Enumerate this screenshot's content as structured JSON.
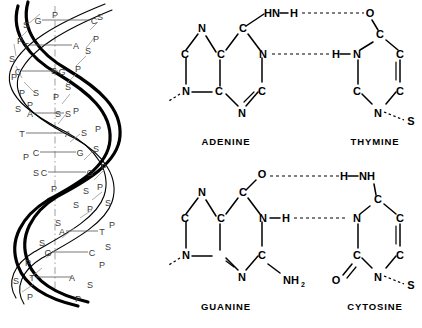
{
  "figure": {
    "panels": [
      "dna-helix",
      "adenine-thymine-pair",
      "guanine-cytosine-pair"
    ]
  },
  "helix": {
    "name": "DNA double helix",
    "backbone_units": {
      "sugar": "S",
      "phosphate": "P"
    },
    "axis_label": "",
    "rungs": [
      {
        "left": "G",
        "right": "C"
      },
      {
        "left": "T",
        "right": "A"
      },
      {
        "left": "C",
        "right": "G"
      },
      {
        "left": "A",
        "right": "S"
      },
      {
        "left": "T",
        "right": "A"
      },
      {
        "left": "C",
        "right": "G"
      },
      {
        "left": "C",
        "right": "G"
      },
      {
        "left": "A",
        "right": "T"
      },
      {
        "left": "G",
        "right": "C"
      },
      {
        "left": "T",
        "right": "A"
      }
    ],
    "backbone_sequence_left": [
      "S",
      "P",
      "S",
      "P",
      "S",
      "P",
      "S",
      "P",
      "S",
      "P",
      "S",
      "P"
    ],
    "backbone_sequence_right": [
      "P",
      "S",
      "P",
      "S",
      "P",
      "S",
      "P",
      "S",
      "P",
      "S",
      "P",
      "S"
    ]
  },
  "pair_at": {
    "name": "adenine-thymine base pair",
    "left_base": {
      "label": "ADENINE",
      "code": "A"
    },
    "right_base": {
      "label": "THYMINE",
      "code": "T"
    },
    "hydrogen_bond_count": 2,
    "hydrogen_bonds": [
      {
        "donor": "HN-H",
        "acceptor": "O"
      },
      {
        "donor": "H",
        "acceptor": "N"
      }
    ],
    "adenine_atoms": [
      "N",
      "C",
      "C",
      "C",
      "N",
      "N",
      "C",
      "C",
      "N"
    ],
    "adenine_amino": "HN",
    "adenine_amino_h": "H",
    "thymine_atoms": [
      "O",
      "C",
      "C",
      "N",
      "H",
      "C",
      "C",
      "N"
    ],
    "sugar_left": "S",
    "sugar_right": "S"
  },
  "pair_gc": {
    "name": "guanine-cytosine base pair",
    "left_base": {
      "label": "GUANINE",
      "code": "G"
    },
    "right_base": {
      "label": "CYTOSINE",
      "code": "C"
    },
    "hydrogen_bond_count": 2,
    "hydrogen_bonds": [
      {
        "donor": "H-NH",
        "acceptor": "O"
      },
      {
        "donor": "N-H",
        "acceptor": "N"
      }
    ],
    "guanine_atoms": [
      "N",
      "C",
      "C",
      "C",
      "O",
      "N",
      "H",
      "C",
      "N",
      "N",
      "C"
    ],
    "guanine_amino": "NH",
    "guanine_amino_sub": "2",
    "cytosine_atoms": [
      "H",
      "NH",
      "C",
      "N",
      "C",
      "C",
      "C",
      "N",
      "O"
    ],
    "sugar_left": "S",
    "sugar_right": "S"
  },
  "colors": {
    "ink": "#000000",
    "paper": "#ffffff",
    "helix_letter": "#3a3a3a",
    "rung": "#555555"
  }
}
